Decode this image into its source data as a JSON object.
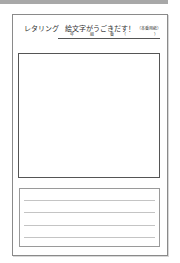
{
  "header": {
    "title": "レタリング",
    "subtitle": "絵文字がうごきだす！",
    "note": "（本番用紙）"
  },
  "name_row": {
    "year_label": "年",
    "class_label": "組",
    "number_label": "番",
    "paren_open": "（",
    "paren_close": "）"
  },
  "lined_area": {
    "line_count": 4
  },
  "colors": {
    "border": "#555555",
    "rule": "#c4c4c4",
    "topbar": "#a8a8a8"
  }
}
